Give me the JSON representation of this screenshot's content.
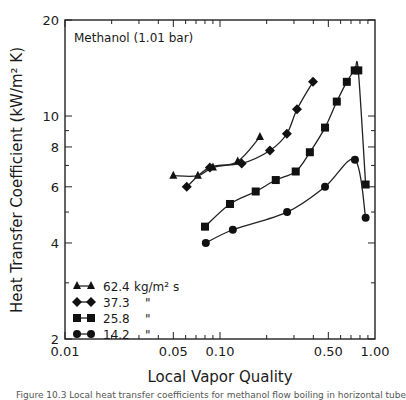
{
  "chart_data": {
    "type": "line",
    "title": "",
    "annotation": "Methanol (1.01 bar)",
    "xlabel": "Local Vapor Quality",
    "ylabel": "Heat Transfer Coefficient (kW/m² K)",
    "xscale": "log",
    "yscale": "log",
    "xlim": [
      0.01,
      1.0
    ],
    "ylim": [
      2,
      20
    ],
    "x_ticks": [
      0.01,
      0.05,
      0.1,
      0.5,
      1.0
    ],
    "x_tick_labels": [
      "0.01",
      "0.05",
      "0.10",
      "0.50",
      "1.00"
    ],
    "y_ticks": [
      2,
      4,
      6,
      8,
      10,
      20
    ],
    "y_tick_labels": [
      "2",
      "4",
      "6",
      "8",
      "10",
      "20"
    ],
    "grid": false,
    "legend_position": "lower left",
    "series": [
      {
        "name": "62.4 kg/m² s",
        "marker": "triangle",
        "x": [
          0.05,
          0.072,
          0.09,
          0.13,
          0.181
        ],
        "y": [
          6.5,
          6.5,
          6.9,
          7.2,
          8.6
        ]
      },
      {
        "name": "37.3",
        "marker": "diamond",
        "x": [
          0.061,
          0.086,
          0.138,
          0.21,
          0.27,
          0.314,
          0.398
        ],
        "y": [
          6.0,
          6.9,
          7.1,
          7.8,
          8.8,
          10.5,
          12.8
        ]
      },
      {
        "name": "25.8",
        "marker": "square",
        "x": [
          0.08,
          0.116,
          0.17,
          0.229,
          0.308,
          0.38,
          0.476,
          0.567,
          0.658,
          0.74,
          0.78,
          0.87
        ],
        "y": [
          4.5,
          5.3,
          5.8,
          6.3,
          6.7,
          7.7,
          9.2,
          11.1,
          12.8,
          13.9,
          13.9,
          6.1
        ]
      },
      {
        "name": "14.2",
        "marker": "circle",
        "x": [
          0.081,
          0.121,
          0.271,
          0.476,
          0.742,
          0.87
        ],
        "y": [
          4.0,
          4.4,
          5.0,
          6.0,
          7.3,
          4.8
        ]
      }
    ]
  },
  "legend": {
    "items": [
      {
        "value": "62.4",
        "unit": "kg/m² s"
      },
      {
        "value": "37.3",
        "unit": "\""
      },
      {
        "value": "25.8",
        "unit": "\""
      },
      {
        "value": "14.2",
        "unit": "\""
      }
    ]
  },
  "caption": "Figure 10.3  Local heat transfer coefficients for methanol flow boiling in horizontal tube"
}
